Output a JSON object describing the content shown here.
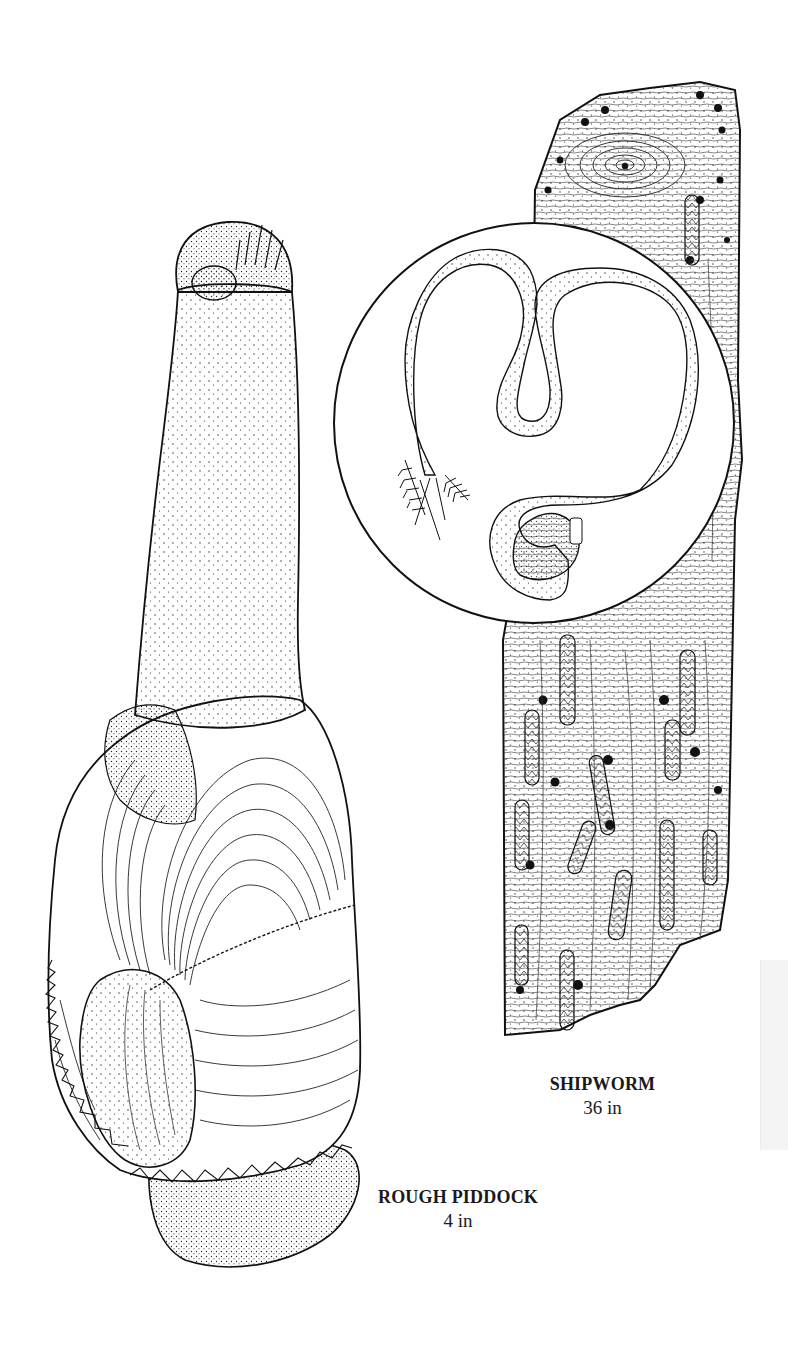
{
  "page": {
    "background": "#ffffff",
    "ink_color": "#1a1a1a"
  },
  "figures": [
    {
      "id": "shipworm",
      "caption": {
        "name": "SHIPWORM",
        "size": "36 in"
      },
      "parts": [
        "bored-timber",
        "inset-circle",
        "worm-body",
        "siphon-plumes",
        "shell-valves"
      ]
    },
    {
      "id": "rough-piddock",
      "caption": {
        "name": "ROUGH PIDDOCK",
        "size": "4 in"
      },
      "parts": [
        "siphon-neck",
        "siphon-tip",
        "shell-left-valve",
        "shell-right-valve",
        "foot"
      ]
    }
  ],
  "labels": {
    "shipworm_name": "SHIPWORM",
    "shipworm_size": "36 in",
    "piddock_name": "ROUGH PIDDOCK",
    "piddock_size": "4 in"
  }
}
